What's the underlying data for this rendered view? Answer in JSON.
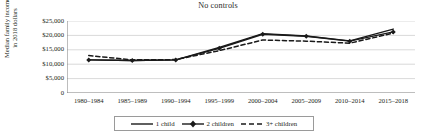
{
  "chart_data": {
    "type": "line",
    "title": "No controls",
    "xlabel": "",
    "ylabel": "Median family income in 2018 dollars",
    "ylabel_line1": "Median family income",
    "ylabel_line2": "in 2018 dollars",
    "categories": [
      "1980–1984",
      "1985–1989",
      "1990–1994",
      "1995–1999",
      "2000–2004",
      "2005–2009",
      "2010–2014",
      "2015–2018"
    ],
    "ylim": [
      0,
      25000
    ],
    "yticks": [
      0,
      5000,
      10000,
      15000,
      20000,
      25000
    ],
    "ytick_labels": [
      "0",
      "$5,000",
      "$10,000",
      "$15,000",
      "$20,000",
      "$25,000"
    ],
    "grid": true,
    "legend_position": "bottom",
    "series": [
      {
        "name": "1 child",
        "style": "solid",
        "marker": "none",
        "color": "#1a1a1a",
        "values": [
          11500,
          11300,
          11500,
          15800,
          20600,
          19800,
          18100,
          22200
        ]
      },
      {
        "name": "2 children",
        "style": "solid",
        "marker": "diamond",
        "color": "#1a1a1a",
        "values": [
          11500,
          11300,
          11500,
          15500,
          20400,
          19700,
          18000,
          21200
        ]
      },
      {
        "name": "3+ children",
        "style": "dashed",
        "marker": "none",
        "color": "#1a1a1a",
        "values": [
          13000,
          11500,
          11600,
          14700,
          18400,
          18000,
          17300,
          20800
        ]
      }
    ]
  },
  "legend": {
    "items": [
      {
        "label": "1 child"
      },
      {
        "label": "2 children"
      },
      {
        "label": "3+ children"
      }
    ]
  }
}
